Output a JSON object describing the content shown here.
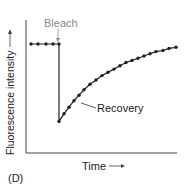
{
  "chart_data": {
    "type": "line",
    "title": "",
    "panel_label": "(D)",
    "xlabel": "Time",
    "xlabel_arrow": "→",
    "ylabel": "Fluorescence intensity",
    "ylabel_arrow": "→",
    "grid": false,
    "legend": null,
    "axis_ticks": false,
    "xlim": [
      0,
      151
    ],
    "ylim": [
      0,
      100
    ],
    "annotations": [
      {
        "text": "Bleach",
        "color": "#888888",
        "points_to": "bleach-event",
        "x": 33,
        "y": 100
      },
      {
        "text": "Recovery",
        "color": "#222222",
        "points_to": "recovery-curve",
        "x": 50,
        "y": 45
      }
    ],
    "series": [
      {
        "name": "pre-bleach",
        "x": [
          5,
          12,
          20,
          27,
          33
        ],
        "y": [
          100,
          100,
          100,
          100,
          100
        ]
      },
      {
        "name": "bleach-drop",
        "x": [
          33,
          33
        ],
        "y": [
          100,
          29
        ]
      },
      {
        "name": "recovery",
        "x": [
          33,
          38,
          43,
          48,
          53,
          58,
          64,
          70,
          76,
          82,
          88,
          94,
          100,
          106,
          112,
          118,
          124,
          130,
          137,
          143,
          150
        ],
        "y": [
          29,
          36,
          42,
          48,
          53,
          58,
          63,
          67,
          71,
          74,
          77,
          80,
          83,
          85,
          87,
          89,
          91,
          93,
          94,
          96,
          97
        ]
      }
    ]
  },
  "labels": {
    "bleach": "Bleach",
    "recovery": "Recovery",
    "ylabel": "Fluorescence intensity",
    "xlabel": "Time",
    "panel": "(D)"
  },
  "colors": {
    "line": "#222222",
    "axis": "#444444",
    "bleach_label": "#888888",
    "text": "#222222"
  }
}
